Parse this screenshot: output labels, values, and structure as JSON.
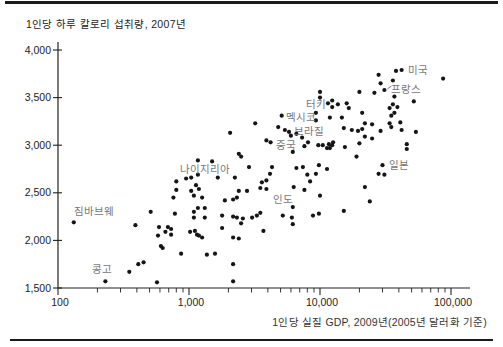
{
  "chart_data": {
    "type": "scatter",
    "title": "1인당 하루 칼로리 섭취량, 2007년",
    "xlabel": "1인당 실질 GDP, 2009년(2005년 달러화 기준)",
    "x_scale": "log",
    "xlim": [
      100,
      140000
    ],
    "ylim": [
      1500,
      4000
    ],
    "x_ticks": [
      100,
      1000,
      10000,
      100000
    ],
    "x_tick_labels": [
      "100",
      "1,000",
      "10,000",
      "100,000"
    ],
    "y_ticks": [
      1500,
      2000,
      2500,
      3000,
      3500,
      4000
    ],
    "y_tick_labels": [
      "1,500",
      "2,000",
      "2,500",
      "3,000",
      "3,500",
      "4,000"
    ],
    "grid": false,
    "dot_color": "#151515",
    "axis_color": "#222222",
    "country_label_color": "#777777",
    "points": [
      [
        38000,
        3780
      ],
      [
        42000,
        3790
      ],
      [
        87000,
        3700
      ],
      [
        36000,
        3680
      ],
      [
        28000,
        3740
      ],
      [
        29000,
        3650
      ],
      [
        20000,
        3560
      ],
      [
        26000,
        3550
      ],
      [
        31000,
        3580
      ],
      [
        37000,
        3510
      ],
      [
        36000,
        3430
      ],
      [
        39000,
        3400
      ],
      [
        52000,
        3460
      ],
      [
        37000,
        3340
      ],
      [
        10000,
        3560
      ],
      [
        10000,
        3500
      ],
      [
        11500,
        3440
      ],
      [
        12400,
        3470
      ],
      [
        12400,
        3400
      ],
      [
        13700,
        3430
      ],
      [
        16000,
        3440
      ],
      [
        16600,
        3390
      ],
      [
        14700,
        3290
      ],
      [
        21000,
        3340
      ],
      [
        34000,
        3390
      ],
      [
        35000,
        3310
      ],
      [
        5100,
        3310
      ],
      [
        9300,
        3340
      ],
      [
        9300,
        3260
      ],
      [
        11900,
        3290
      ],
      [
        22000,
        3230
      ],
      [
        25000,
        3220
      ],
      [
        34000,
        3230
      ],
      [
        41000,
        3240
      ],
      [
        35000,
        3190
      ],
      [
        3200,
        3230
      ],
      [
        2060,
        3130
      ],
      [
        4800,
        3190
      ],
      [
        5400,
        3160
      ],
      [
        5800,
        3140
      ],
      [
        15200,
        3180
      ],
      [
        17500,
        3160
      ],
      [
        19500,
        3150
      ],
      [
        21000,
        3170
      ],
      [
        29000,
        3150
      ],
      [
        42000,
        3160
      ],
      [
        54000,
        3140
      ],
      [
        3900,
        3050
      ],
      [
        4200,
        3030
      ],
      [
        7300,
        3080
      ],
      [
        8100,
        3030
      ],
      [
        9700,
        3000
      ],
      [
        11300,
        2970
      ],
      [
        12600,
        3030
      ],
      [
        7600,
        2990
      ],
      [
        10500,
        3000
      ],
      [
        11700,
        3010
      ],
      [
        25000,
        3070
      ],
      [
        22000,
        3090
      ],
      [
        12400,
        3000
      ],
      [
        11900,
        2970
      ],
      [
        15500,
        2980
      ],
      [
        6200,
        2930
      ],
      [
        2400,
        2910
      ],
      [
        2500,
        2880
      ],
      [
        1170,
        2840
      ],
      [
        1500,
        2830
      ],
      [
        2870,
        2770
      ],
      [
        4150,
        2700
      ],
      [
        4300,
        2770
      ],
      [
        6600,
        2760
      ],
      [
        7400,
        2770
      ],
      [
        9800,
        2790
      ],
      [
        11300,
        2750
      ],
      [
        9300,
        2700
      ],
      [
        19000,
        2880
      ],
      [
        30000,
        2790
      ],
      [
        28000,
        2700
      ],
      [
        31000,
        2690
      ],
      [
        46000,
        3010
      ],
      [
        46000,
        2960
      ],
      [
        20000,
        3020
      ],
      [
        800,
        2620
      ],
      [
        950,
        2650
      ],
      [
        1040,
        2660
      ],
      [
        1130,
        2580
      ],
      [
        800,
        2530
      ],
      [
        760,
        2450
      ],
      [
        1090,
        2470
      ],
      [
        1170,
        2690
      ],
      [
        1660,
        2660
      ],
      [
        2240,
        2660
      ],
      [
        3600,
        2610
      ],
      [
        3900,
        2630
      ],
      [
        3900,
        2540
      ],
      [
        3500,
        2550
      ],
      [
        2400,
        2520
      ],
      [
        2770,
        2520
      ],
      [
        1040,
        2520
      ],
      [
        1260,
        2450
      ],
      [
        1190,
        2540
      ],
      [
        6300,
        2560
      ],
      [
        7600,
        2530
      ],
      [
        8400,
        2620
      ],
      [
        8000,
        2690
      ],
      [
        10000,
        2470
      ],
      [
        22000,
        2560
      ],
      [
        1880,
        2420
      ],
      [
        2170,
        2430
      ],
      [
        2320,
        2450
      ],
      [
        1170,
        2340
      ],
      [
        1320,
        2340
      ],
      [
        1090,
        2240
      ],
      [
        1320,
        2240
      ],
      [
        1790,
        2260
      ],
      [
        2170,
        2250
      ],
      [
        2320,
        2240
      ],
      [
        2580,
        2230
      ],
      [
        3030,
        2240
      ],
      [
        3300,
        2260
      ],
      [
        3500,
        2290
      ],
      [
        1790,
        2130
      ],
      [
        2500,
        2180
      ],
      [
        1020,
        2090
      ],
      [
        1190,
        2050
      ],
      [
        1260,
        2030
      ],
      [
        2170,
        2030
      ],
      [
        2400,
        2020
      ],
      [
        6200,
        2350
      ],
      [
        5200,
        2260
      ],
      [
        6100,
        2240
      ],
      [
        6200,
        2170
      ],
      [
        8850,
        2260
      ],
      [
        9800,
        2280
      ],
      [
        3700,
        2100
      ],
      [
        24000,
        2410
      ],
      [
        15200,
        2310
      ],
      [
        132,
        2190
      ],
      [
        390,
        2160
      ],
      [
        510,
        2300
      ],
      [
        780,
        2280
      ],
      [
        1090,
        2300
      ],
      [
        590,
        2140
      ],
      [
        690,
        2140
      ],
      [
        730,
        2120
      ],
      [
        660,
        2090
      ],
      [
        730,
        2060
      ],
      [
        580,
        2050
      ],
      [
        1110,
        2100
      ],
      [
        1150,
        2060
      ],
      [
        610,
        1940
      ],
      [
        630,
        1920
      ],
      [
        870,
        1860
      ],
      [
        1370,
        1850
      ],
      [
        1580,
        1860
      ],
      [
        350,
        1670
      ],
      [
        410,
        1750
      ],
      [
        450,
        1770
      ],
      [
        230,
        1570
      ],
      [
        570,
        1560
      ],
      [
        2170,
        1750
      ],
      [
        2170,
        1570
      ],
      [
        6000,
        3100
      ],
      [
        6600,
        3120
      ]
    ],
    "labeled_points": [
      {
        "name": "미국",
        "gdp": 42000,
        "cal": 3790,
        "dx": 6,
        "dy": -5
      },
      {
        "name": "프랑스",
        "gdp": 31000,
        "cal": 3580,
        "dx": 7,
        "dy": -6,
        "arrow": true
      },
      {
        "name": "터키",
        "gdp": 10000,
        "cal": 3500,
        "dx": -14,
        "dy": 1
      },
      {
        "name": "멕시코",
        "gdp": 5100,
        "cal": 3310,
        "dx": 4,
        "dy": -4
      },
      {
        "name": "브라질",
        "gdp": 5800,
        "cal": 3140,
        "dx": 5,
        "dy": -6
      },
      {
        "name": "중국",
        "gdp": 8100,
        "cal": 3030,
        "dx": -32,
        "dy": -2
      },
      {
        "name": "나이지리아",
        "gdp": 1170,
        "cal": 2690,
        "dx": -18,
        "dy": -11
      },
      {
        "name": "인도",
        "gdp": 2770,
        "cal": 2520,
        "dx": 26,
        "dy": 3
      },
      {
        "name": "일본",
        "gdp": 30000,
        "cal": 2790,
        "dx": 6,
        "dy": -5
      },
      {
        "name": "짐바브웨",
        "gdp": 132,
        "cal": 2190,
        "dx": 0,
        "dy": -16
      },
      {
        "name": "콩고",
        "gdp": 230,
        "cal": 1570,
        "dx": -13,
        "dy": -17
      }
    ]
  }
}
